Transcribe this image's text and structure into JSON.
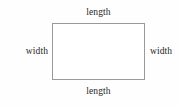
{
  "diagram": {
    "name": "rectangle-dimension-diagram",
    "type": "geometry-figure",
    "shape": "rectangle",
    "background_color": "#fefefe",
    "stroke_color": "#9a9a9a",
    "fill_color": "#ffffff",
    "text_color": "#1f1f1f"
  },
  "labels": {
    "top": "length",
    "bottom": "length",
    "left": "width",
    "right": "width"
  },
  "chart_data": {
    "type": "diagram",
    "title": "",
    "shape": "rectangle",
    "annotations": [
      {
        "side": "top",
        "text": "length"
      },
      {
        "side": "right",
        "text": "width"
      },
      {
        "side": "bottom",
        "text": "length"
      },
      {
        "side": "left",
        "text": "width"
      }
    ]
  }
}
